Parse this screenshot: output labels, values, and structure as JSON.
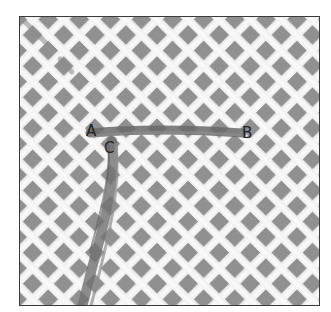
{
  "figure": {
    "labels": [
      {
        "id": "A",
        "text": "A"
      },
      {
        "id": "B",
        "text": "B"
      },
      {
        "id": "C",
        "text": "C"
      }
    ]
  },
  "colors": {
    "mesh": "#f2f2f2",
    "hole": "#8f8f8f",
    "yarn": "#6e6e6e",
    "border": "#3a3a3a",
    "label": "#222222"
  }
}
